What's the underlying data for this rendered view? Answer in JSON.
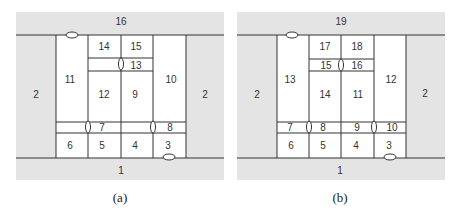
{
  "figure": {
    "colors": {
      "background_zone": "#e4e4e4",
      "room": "#ffffff",
      "line": "#333333",
      "text": "#333333"
    },
    "panels": [
      {
        "caption": "(a)",
        "outer_labels": {
          "top": "16",
          "bottom": "1",
          "left": "2",
          "right": "2"
        },
        "rooms": [
          {
            "id": "14",
            "label": "14"
          },
          {
            "id": "15",
            "label": "15"
          },
          {
            "id": "13",
            "label": "13"
          },
          {
            "id": "11",
            "label": "11"
          },
          {
            "id": "12",
            "label": "12"
          },
          {
            "id": "9",
            "label": "9"
          },
          {
            "id": "10",
            "label": "10"
          },
          {
            "id": "7",
            "label": "7"
          },
          {
            "id": "8",
            "label": "8"
          },
          {
            "id": "6",
            "label": "6"
          },
          {
            "id": "5",
            "label": "5"
          },
          {
            "id": "4",
            "label": "4"
          },
          {
            "id": "3",
            "label": "3"
          }
        ]
      },
      {
        "caption": "(b)",
        "outer_labels": {
          "top": "19",
          "bottom": "1",
          "left": "2",
          "right": "2"
        },
        "rooms": [
          {
            "id": "17",
            "label": "17"
          },
          {
            "id": "18",
            "label": "18"
          },
          {
            "id": "15",
            "label": "15"
          },
          {
            "id": "16",
            "label": "16"
          },
          {
            "id": "13",
            "label": "13"
          },
          {
            "id": "14",
            "label": "14"
          },
          {
            "id": "11",
            "label": "11"
          },
          {
            "id": "12",
            "label": "12"
          },
          {
            "id": "7",
            "label": "7"
          },
          {
            "id": "8",
            "label": "8"
          },
          {
            "id": "9",
            "label": "9"
          },
          {
            "id": "10",
            "label": "10"
          },
          {
            "id": "6",
            "label": "6"
          },
          {
            "id": "5",
            "label": "5"
          },
          {
            "id": "4",
            "label": "4"
          },
          {
            "id": "3",
            "label": "3"
          }
        ]
      }
    ]
  }
}
